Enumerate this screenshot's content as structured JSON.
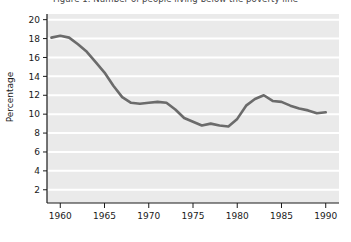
{
  "chart_data": {
    "type": "line",
    "title": "Figure 1. Number of people living below the poverty line",
    "xlabel": "",
    "ylabel": "Percentage",
    "xlim": [
      1958.5,
      1991.5
    ],
    "ylim": [
      0.6,
      20.6
    ],
    "xticks": [
      1960,
      1965,
      1970,
      1975,
      1980,
      1985,
      1990
    ],
    "yticks": [
      2,
      4,
      6,
      8,
      10,
      12,
      14,
      16,
      18,
      20
    ],
    "grid": "horizontal",
    "legend": "none",
    "plot_background": "#eaeaea",
    "gridline_color": "#ffffff",
    "line_color": "#6b6b6b",
    "line_width": 2.6,
    "x": [
      1959,
      1960,
      1961,
      1962,
      1963,
      1964,
      1965,
      1966,
      1967,
      1968,
      1969,
      1970,
      1971,
      1972,
      1973,
      1974,
      1975,
      1976,
      1977,
      1978,
      1979,
      1980,
      1981,
      1982,
      1983,
      1984,
      1985,
      1986,
      1987,
      1988,
      1989,
      1990
    ],
    "values": [
      18.1,
      18.3,
      18.1,
      17.4,
      16.6,
      15.5,
      14.4,
      13.0,
      11.8,
      11.2,
      11.1,
      11.2,
      11.3,
      11.2,
      10.5,
      9.6,
      9.2,
      8.8,
      9.0,
      8.8,
      8.7,
      9.5,
      10.9,
      11.6,
      12.0,
      11.4,
      11.3,
      10.9,
      10.6,
      10.4,
      10.1,
      10.2
    ]
  }
}
